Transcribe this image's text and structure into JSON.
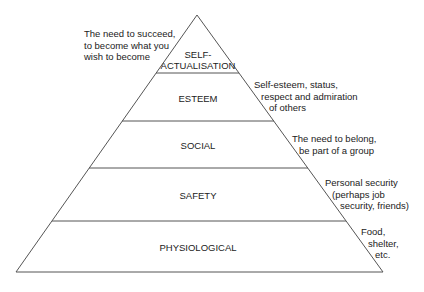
{
  "diagram": {
    "type": "pyramid",
    "line_color": "#555555",
    "levels": [
      {
        "name": "self-actualisation",
        "label_line1": "SELF-",
        "label_line2": "ACTUALISATION",
        "note": [
          "The need to succeed,",
          "to become what you",
          "wish to become"
        ]
      },
      {
        "name": "esteem",
        "label": "ESTEEM",
        "note": [
          "Self-esteem, status,",
          "respect and admiration",
          "of others"
        ]
      },
      {
        "name": "social",
        "label": "SOCIAL",
        "note": [
          "The need to belong,",
          "be part of a group"
        ]
      },
      {
        "name": "safety",
        "label": "SAFETY",
        "note": [
          "Personal security",
          "(perhaps job",
          "security, friends)"
        ]
      },
      {
        "name": "physiological",
        "label": "PHYSIOLOGICAL",
        "note": [
          "Food,",
          "shelter,",
          "etc."
        ]
      }
    ]
  }
}
